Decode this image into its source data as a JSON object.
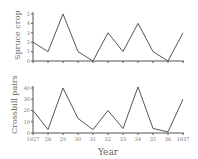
{
  "chart_data": [
    {
      "type": "line",
      "title": "",
      "xlabel": "",
      "ylabel": "Spruce crop",
      "x": [
        1927,
        1928,
        1929,
        1930,
        1931,
        1932,
        1933,
        1934,
        1935,
        1936,
        1937
      ],
      "values": [
        2,
        1,
        5,
        1,
        0,
        3,
        1,
        4,
        1,
        0,
        3
      ],
      "yticks": [
        "0",
        "1",
        "2",
        "3",
        "4",
        "5"
      ],
      "ylim": [
        0,
        5
      ],
      "grid": false
    },
    {
      "type": "line",
      "title": "",
      "xlabel": "Year",
      "ylabel": "Crossbill pairs",
      "x": [
        1927,
        1928,
        1929,
        1930,
        1931,
        1932,
        1933,
        1934,
        1935,
        1936,
        1937
      ],
      "values": [
        20,
        3,
        40,
        13,
        3,
        20,
        4,
        41,
        4,
        1,
        30
      ],
      "yticks": [
        "0",
        "10",
        "20",
        "30",
        "40"
      ],
      "xtick_labels": [
        "1927",
        "28",
        "29",
        "30",
        "31",
        "32",
        "33",
        "34",
        "35",
        "36",
        "1937"
      ],
      "ylim": [
        0,
        45
      ],
      "grid": false
    }
  ],
  "labels": {
    "top_ylabel": "Spruce crop",
    "bottom_ylabel": "Crossbill pairs",
    "xlabel": "Year"
  }
}
